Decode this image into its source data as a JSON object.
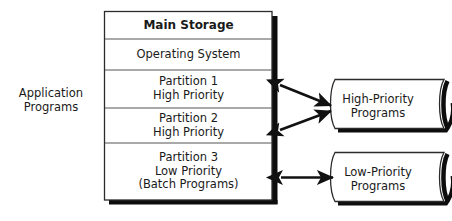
{
  "diagram": {
    "type": "block-diagram",
    "background_color": "#ffffff",
    "line_color": "#1a1a1a",
    "shadow_color": "#000000",
    "side_label": {
      "name": "application-programs-label",
      "line1": "Application",
      "line2": "Programs"
    },
    "main_storage": {
      "title": "Main Storage",
      "rows": [
        {
          "id": "operating-system",
          "line1": "Operating System",
          "line2": "",
          "line3": ""
        },
        {
          "id": "partition-1",
          "line1": "Partition 1",
          "line2": "High Priority",
          "line3": ""
        },
        {
          "id": "partition-2",
          "line1": "Partition 2",
          "line2": "High Priority",
          "line3": ""
        },
        {
          "id": "partition-3",
          "line1": "Partition 3",
          "line2": "Low Priority",
          "line3": "(Batch Programs)"
        }
      ]
    },
    "program_stores": [
      {
        "id": "high-priority-programs",
        "shape": "tape",
        "line1": "High-Priority",
        "line2": "Programs"
      },
      {
        "id": "low-priority-programs",
        "shape": "tape",
        "line1": "Low-Priority",
        "line2": "Programs"
      }
    ],
    "connectors": [
      {
        "id": "partition-1-to-high-priority",
        "style": "double-headed-arrow"
      },
      {
        "id": "partition-2-to-high-priority",
        "style": "double-headed-arrow"
      },
      {
        "id": "partition-3-to-low-priority",
        "style": "double-headed-arrow"
      }
    ]
  }
}
